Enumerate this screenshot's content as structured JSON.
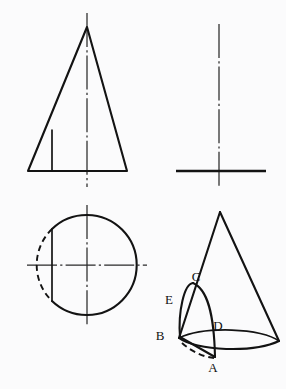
{
  "drawing": {
    "title": "Cone with curved cut - orthographic projection",
    "background_color": "#fbfbfc",
    "line_color": "#131313",
    "center_line_color": "#2a2a2a"
  },
  "views": {
    "front": {
      "name": "front-view",
      "shape": "triangle",
      "apex": {
        "x": 87,
        "y": 27
      },
      "base_left": {
        "x": 28,
        "y": 171
      },
      "base_right": {
        "x": 127,
        "y": 171
      },
      "cut_line": {
        "x": 52,
        "y_top": 130,
        "y_bottom": 171
      },
      "center_line": {
        "x": 87,
        "y_top": 13,
        "y_bottom": 187
      }
    },
    "side": {
      "name": "side-view",
      "shape": "tee",
      "center_line": {
        "x": 219,
        "y_top": 24,
        "y_bottom": 187
      },
      "base_line": {
        "x_left": 176,
        "x_right": 266,
        "y": 171
      }
    },
    "top": {
      "name": "top-view",
      "shape": "circle",
      "center": {
        "x": 87,
        "y": 265
      },
      "radius": 50,
      "chord_x": 52,
      "chord_y_top": 229,
      "chord_y_bottom": 301,
      "center_line_h": {
        "x_left": 27,
        "x_right": 147,
        "y": 265
      },
      "center_line_v": {
        "x": 87,
        "y_top": 205,
        "y_bottom": 325
      }
    },
    "pictorial": {
      "name": "pictorial-view",
      "shape": "cone-with-cut",
      "apex": {
        "x": 220,
        "y": 212
      },
      "base_center": {
        "x": 222,
        "y": 341
      },
      "base_rx": 57,
      "base_ry": 18
    }
  },
  "labels": [
    {
      "id": "A",
      "text": "A",
      "x": 213,
      "y": 372
    },
    {
      "id": "B",
      "text": "B",
      "x": 160,
      "y": 340
    },
    {
      "id": "C",
      "text": "C",
      "x": 196,
      "y": 281
    },
    {
      "id": "D",
      "text": "D",
      "x": 218,
      "y": 330
    },
    {
      "id": "E",
      "text": "E",
      "x": 169,
      "y": 304
    }
  ]
}
